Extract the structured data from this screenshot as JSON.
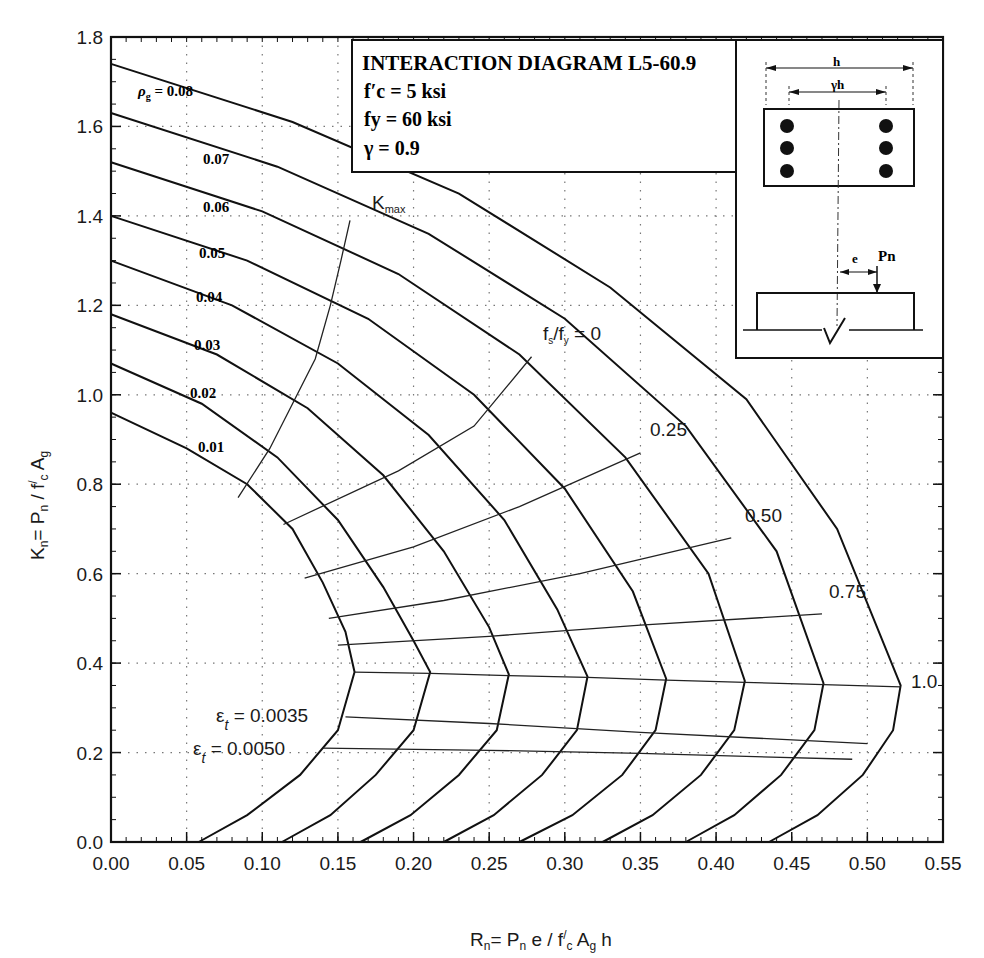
{
  "chart_data": {
    "type": "line",
    "title": "INTERACTION DIAGRAM L5-60.9",
    "parameters": [
      "f'c = 5 ksi",
      "fy = 60 ksi",
      "γ = 0.9"
    ],
    "xlabel": "Rn = Pn e / f'c Ag h",
    "ylabel": "Kn = Pn / f'c Ag",
    "xlim": [
      0,
      0.55
    ],
    "ylim": [
      0,
      1.8
    ],
    "x_ticks": [
      "0.00",
      "0.05",
      "0.10",
      "0.15",
      "0.20",
      "0.25",
      "0.30",
      "0.35",
      "0.40",
      "0.45",
      "0.50",
      "0.55"
    ],
    "y_ticks": [
      "0.0",
      "0.2",
      "0.4",
      "0.6",
      "0.8",
      "1.0",
      "1.2",
      "1.4",
      "1.6",
      "1.8"
    ],
    "grid": "dotted",
    "series": [
      {
        "name": "ρg = 0.01",
        "label": "0.01",
        "points": [
          [
            0,
            0.96
          ],
          [
            0.05,
            0.88
          ],
          [
            0.09,
            0.8
          ],
          [
            0.12,
            0.7
          ],
          [
            0.14,
            0.58
          ],
          [
            0.155,
            0.47
          ],
          [
            0.161,
            0.38
          ],
          [
            0.15,
            0.25
          ],
          [
            0.125,
            0.15
          ],
          [
            0.09,
            0.06
          ],
          [
            0.058,
            0
          ]
        ]
      },
      {
        "name": "ρg = 0.02",
        "label": "0.02",
        "points": [
          [
            0,
            1.07
          ],
          [
            0.06,
            0.98
          ],
          [
            0.11,
            0.86
          ],
          [
            0.15,
            0.72
          ],
          [
            0.18,
            0.57
          ],
          [
            0.2,
            0.45
          ],
          [
            0.211,
            0.38
          ],
          [
            0.2,
            0.25
          ],
          [
            0.175,
            0.15
          ],
          [
            0.145,
            0.06
          ],
          [
            0.113,
            0
          ]
        ]
      },
      {
        "name": "ρg = 0.03",
        "label": "0.03",
        "points": [
          [
            0,
            1.18
          ],
          [
            0.07,
            1.09
          ],
          [
            0.13,
            0.97
          ],
          [
            0.18,
            0.82
          ],
          [
            0.22,
            0.65
          ],
          [
            0.25,
            0.48
          ],
          [
            0.263,
            0.375
          ],
          [
            0.255,
            0.25
          ],
          [
            0.23,
            0.15
          ],
          [
            0.198,
            0.06
          ],
          [
            0.165,
            0
          ]
        ]
      },
      {
        "name": "ρg = 0.04",
        "label": "0.04",
        "points": [
          [
            0,
            1.3
          ],
          [
            0.08,
            1.2
          ],
          [
            0.15,
            1.07
          ],
          [
            0.21,
            0.91
          ],
          [
            0.26,
            0.72
          ],
          [
            0.295,
            0.52
          ],
          [
            0.315,
            0.37
          ],
          [
            0.308,
            0.25
          ],
          [
            0.285,
            0.15
          ],
          [
            0.253,
            0.06
          ],
          [
            0.22,
            0
          ]
        ]
      },
      {
        "name": "ρg = 0.05",
        "label": "0.05",
        "points": [
          [
            0,
            1.4
          ],
          [
            0.09,
            1.3
          ],
          [
            0.17,
            1.17
          ],
          [
            0.24,
            1.0
          ],
          [
            0.3,
            0.79
          ],
          [
            0.345,
            0.56
          ],
          [
            0.367,
            0.365
          ],
          [
            0.36,
            0.25
          ],
          [
            0.338,
            0.15
          ],
          [
            0.305,
            0.06
          ],
          [
            0.27,
            0
          ]
        ]
      },
      {
        "name": "ρg = 0.06",
        "label": "0.06",
        "points": [
          [
            0,
            1.52
          ],
          [
            0.1,
            1.41
          ],
          [
            0.19,
            1.27
          ],
          [
            0.27,
            1.09
          ],
          [
            0.34,
            0.86
          ],
          [
            0.395,
            0.6
          ],
          [
            0.419,
            0.36
          ],
          [
            0.412,
            0.25
          ],
          [
            0.39,
            0.15
          ],
          [
            0.358,
            0.06
          ],
          [
            0.325,
            0
          ]
        ]
      },
      {
        "name": "ρg = 0.07",
        "label": "0.07",
        "points": [
          [
            0,
            1.63
          ],
          [
            0.11,
            1.51
          ],
          [
            0.21,
            1.36
          ],
          [
            0.3,
            1.17
          ],
          [
            0.38,
            0.93
          ],
          [
            0.44,
            0.65
          ],
          [
            0.471,
            0.355
          ],
          [
            0.465,
            0.25
          ],
          [
            0.443,
            0.15
          ],
          [
            0.412,
            0.06
          ],
          [
            0.38,
            0
          ]
        ]
      },
      {
        "name": "ρg = 0.08",
        "label": "ρg = 0.08",
        "points": [
          [
            0,
            1.74
          ],
          [
            0.12,
            1.61
          ],
          [
            0.23,
            1.45
          ],
          [
            0.33,
            1.24
          ],
          [
            0.42,
            0.99
          ],
          [
            0.48,
            0.7
          ],
          [
            0.522,
            0.35
          ],
          [
            0.517,
            0.25
          ],
          [
            0.497,
            0.15
          ],
          [
            0.467,
            0.06
          ],
          [
            0.435,
            0
          ]
        ]
      }
    ],
    "reference_lines": [
      {
        "name": "Kmax",
        "label": "Kmax",
        "points": [
          [
            0.084,
            0.77
          ],
          [
            0.105,
            0.88
          ],
          [
            0.12,
            0.98
          ],
          [
            0.135,
            1.08
          ],
          [
            0.145,
            1.2
          ],
          [
            0.152,
            1.3
          ],
          [
            0.158,
            1.39
          ]
        ]
      },
      {
        "name": "fs/fy = 0",
        "label": "fs/fy = 0",
        "points": [
          [
            0.114,
            0.71
          ],
          [
            0.19,
            0.83
          ],
          [
            0.24,
            0.93
          ],
          [
            0.278,
            1.085
          ]
        ]
      },
      {
        "name": "fs/fy = 0.25",
        "label": "0.25",
        "points": [
          [
            0.128,
            0.59
          ],
          [
            0.2,
            0.66
          ],
          [
            0.27,
            0.75
          ],
          [
            0.35,
            0.87
          ]
        ]
      },
      {
        "name": "fs/fy = 0.50",
        "label": "0.50",
        "points": [
          [
            0.144,
            0.5
          ],
          [
            0.22,
            0.54
          ],
          [
            0.31,
            0.6
          ],
          [
            0.41,
            0.68
          ]
        ]
      },
      {
        "name": "fs/fy = 0.75",
        "label": "0.75",
        "points": [
          [
            0.15,
            0.44
          ],
          [
            0.25,
            0.46
          ],
          [
            0.35,
            0.485
          ],
          [
            0.47,
            0.51
          ]
        ]
      },
      {
        "name": "fs/fy = 1.0",
        "label": "1.0",
        "points": [
          [
            0.161,
            0.38
          ],
          [
            0.211,
            0.377
          ],
          [
            0.263,
            0.372
          ],
          [
            0.315,
            0.368
          ],
          [
            0.367,
            0.362
          ],
          [
            0.419,
            0.357
          ],
          [
            0.471,
            0.352
          ],
          [
            0.522,
            0.347
          ]
        ]
      },
      {
        "name": "εt = 0.0035",
        "label": "εt = 0.0035",
        "points": [
          [
            0.155,
            0.28
          ],
          [
            0.25,
            0.265
          ],
          [
            0.35,
            0.245
          ],
          [
            0.5,
            0.22
          ]
        ]
      },
      {
        "name": "εt = 0.0050",
        "label": "εt = 0.0050",
        "points": [
          [
            0.14,
            0.21
          ],
          [
            0.25,
            0.205
          ],
          [
            0.35,
            0.198
          ],
          [
            0.49,
            0.185
          ]
        ]
      }
    ],
    "inset": {
      "section_labels": [
        "h",
        "γh"
      ],
      "load_labels": [
        "e",
        "Pn"
      ],
      "bars_per_side": 3
    }
  },
  "legend_box": {
    "title": "INTERACTION DIAGRAM L5-60.9",
    "fc": "f′c = 5 ksi",
    "fy": "fy = 60 ksi",
    "gamma": "γ = 0.9"
  }
}
